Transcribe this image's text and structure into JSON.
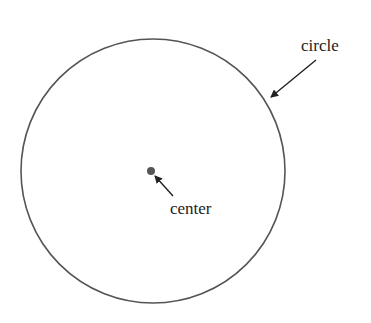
{
  "diagram": {
    "type": "geometry",
    "shape": "circle",
    "colors": {
      "stroke": "#555555",
      "center_dot": "#555555",
      "arrow": "#222222",
      "text": "#222222",
      "background": "#ffffff"
    },
    "circle": {
      "cx": 153,
      "cy": 171,
      "r": 132
    },
    "center_point": {
      "cx": 151,
      "cy": 171,
      "r": 4
    },
    "labels": [
      {
        "id": "circle",
        "text": "circle",
        "x": 301,
        "y": 51,
        "arrow": {
          "x1": 316,
          "y1": 60,
          "x2": 271,
          "y2": 97
        }
      },
      {
        "id": "center",
        "text": "center",
        "x": 170,
        "y": 214,
        "arrow": {
          "x1": 173,
          "y1": 196,
          "x2": 155,
          "y2": 176
        }
      }
    ]
  }
}
